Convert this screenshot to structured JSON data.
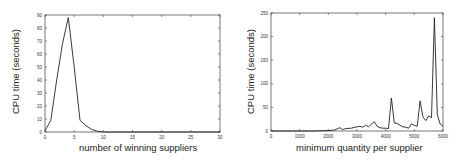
{
  "chart_data": [
    {
      "type": "line",
      "title": "",
      "xlabel": "number of winning suppliers",
      "ylabel": "CPU time (seconds)",
      "xlim": [
        0,
        30
      ],
      "ylim": [
        0,
        90
      ],
      "xticks": [
        0,
        5,
        10,
        15,
        20,
        25,
        30
      ],
      "yticks": [
        0,
        10,
        20,
        30,
        40,
        50,
        60,
        70,
        80,
        90
      ],
      "grid": false,
      "legend": null,
      "series": [
        {
          "name": "CPU time",
          "x": [
            0,
            1,
            2,
            3,
            4,
            5,
            6,
            7,
            8,
            9,
            10,
            15,
            20,
            25,
            30
          ],
          "y": [
            1,
            9,
            40,
            68,
            88,
            50,
            9,
            5,
            2,
            0.5,
            0,
            0,
            0,
            0,
            0
          ]
        }
      ]
    },
    {
      "type": "line",
      "title": "",
      "xlabel": "minimum quantity per supplier",
      "ylabel": "CPU time (seconds)",
      "xlim": [
        0,
        6000
      ],
      "ylim": [
        0,
        250
      ],
      "xticks": [
        0,
        1000,
        2000,
        3000,
        4000,
        5000,
        6000
      ],
      "yticks": [
        0,
        50,
        100,
        150,
        200,
        250
      ],
      "grid": false,
      "legend": null,
      "series": [
        {
          "name": "CPU time",
          "x": [
            0,
            500,
            1000,
            1500,
            2000,
            2200,
            2400,
            2500,
            2600,
            2800,
            3000,
            3100,
            3200,
            3300,
            3400,
            3500,
            3600,
            3700,
            3800,
            3900,
            4000,
            4100,
            4200,
            4300,
            4400,
            4500,
            4600,
            4700,
            4800,
            4900,
            5000,
            5100,
            5200,
            5300,
            5400,
            5500,
            5600,
            5700,
            5800,
            5900,
            6000
          ],
          "y": [
            0,
            0,
            0,
            0,
            1,
            2,
            7,
            3,
            5,
            6,
            9,
            10,
            8,
            12,
            9,
            14,
            20,
            10,
            7,
            6,
            6,
            5,
            70,
            17,
            16,
            12,
            9,
            8,
            6,
            15,
            12,
            10,
            64,
            30,
            22,
            32,
            28,
            240,
            35,
            15,
            10
          ]
        }
      ]
    }
  ],
  "charts": [
    {
      "xlabel": "number of winning suppliers",
      "ylabel": "CPU time (seconds)"
    },
    {
      "xlabel": "minimum quantity per supplier",
      "ylabel": "CPU time (seconds)"
    }
  ]
}
